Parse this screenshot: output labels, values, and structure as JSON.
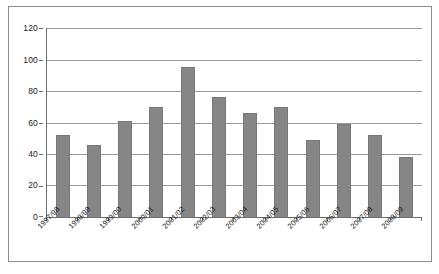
{
  "chart_data": {
    "type": "bar",
    "title": "",
    "xlabel": "",
    "ylabel": "",
    "categories": [
      "1997/98",
      "1998/99",
      "1999/00",
      "2000/01",
      "2001/02",
      "2002/03",
      "2003/04",
      "2004/05",
      "2005/06",
      "2006/07",
      "2007/08",
      "2008/09"
    ],
    "values": [
      52,
      46,
      61,
      70,
      95,
      76,
      66,
      70,
      49,
      59,
      52,
      38
    ],
    "ylim": [
      0,
      120
    ],
    "y_ticks": [
      0,
      20,
      40,
      60,
      80,
      100,
      120
    ],
    "y_tick_labels": [
      "0",
      "20",
      "40",
      "60",
      "80",
      "100",
      "120"
    ],
    "grid": true,
    "legend": false,
    "legend_position": "none",
    "bar_color": "#868686",
    "gridline_color": "#9a9a9a",
    "axis_color": "#6e6e6e",
    "frame_color": "#8d8d8d",
    "series": [
      {
        "name": "",
        "values": [
          52,
          46,
          61,
          70,
          95,
          76,
          66,
          70,
          49,
          59,
          52,
          38
        ]
      }
    ]
  }
}
